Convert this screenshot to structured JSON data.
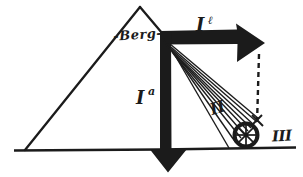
{
  "colors": {
    "ink": "#1b1b1b",
    "bg": "#ffffff"
  },
  "diagram": {
    "mountain_label": "-Berg-",
    "arrow_right_label": {
      "main": "I",
      "sup": "ℓ"
    },
    "arrow_down_label": {
      "main": "I",
      "sup": "a"
    },
    "ray_fan_label": "II",
    "wheel_label": "III"
  }
}
